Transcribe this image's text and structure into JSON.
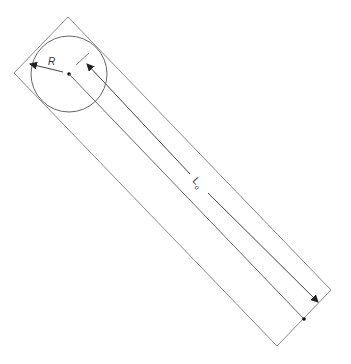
{
  "diagram": {
    "labels": {
      "radius": "R",
      "length": "L",
      "length_subscript": "o"
    },
    "colors": {
      "stroke": "#888888",
      "dimension": "#444444",
      "background": "#ffffff"
    },
    "rectangle": {
      "corners": [
        [
          68,
          17
        ],
        [
          331,
          290
        ],
        [
          277,
          346
        ],
        [
          14,
          73
        ]
      ]
    },
    "circle": {
      "cx": 69,
      "cy": 74,
      "r": 38
    },
    "caption": ""
  }
}
